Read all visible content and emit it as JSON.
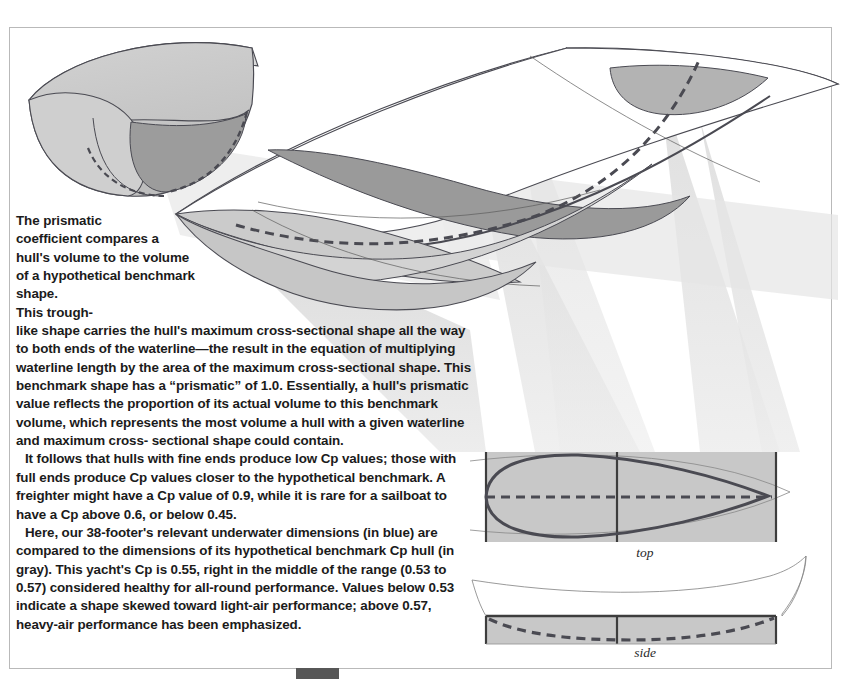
{
  "page": {
    "title": "The prismatic coefficient",
    "background_color": "#ffffff",
    "frame_color": "#b9b9b9"
  },
  "colors": {
    "hull_line": "#4a4a52",
    "benchmark_fill": "#c9c9c9",
    "benchmark_fill_light": "#dcdcdc",
    "shadow_fill": "#e0e0e0",
    "dark_section": "#9a9a9a",
    "mid_section": "#b5b5b5",
    "projection_ray": "#e3e3e3",
    "text": "#1b1b1b",
    "tab": "#575757",
    "caption": "#2a2a2a"
  },
  "body_copy": {
    "paragraph_1_lines": [
      "The prismatic",
      "coefficient compares",
      "a hull's volume to the",
      "volume of a hypothetical",
      "benchmark shape. This trough-",
      "like shape carries the hull's maximum",
      "cross-sectional shape all the way to both",
      "ends of the waterline—the result in the",
      "equation of multiplying waterline length by the",
      "area of the maximum cross-sectional shape. This",
      "benchmark shape has a “prismatic” of 1.0. Essentially, a",
      "hull's prismatic value reflects the proportion of its actual",
      "volume to this benchmark volume, which represents the most",
      "volume a hull with a given waterline and maximum cross-",
      "sectional shape could contain."
    ],
    "paragraph_2": "It follows that hulls with fine ends produce low Cp values; those with full ends produce Cp values closer to the hypothetical benchmark. A freighter might have a Cp value of 0.9, while it is rare for a sailboat to have a Cp above 0.6, or below 0.45.",
    "paragraph_3": "Here, our 38-footer's relevant underwater dimensions (in blue) are compared to the dimensions of its hypothetical benchmark Cp hull (in gray). This yacht's Cp is 0.55, right in the middle of the range (0.53 to 0.57) considered healthy for all-round performance. Values below 0.53 indicate a shape skewed toward light-air performance; above 0.57, heavy-air performance has been emphasized."
  },
  "captions": {
    "top_view": "top",
    "side_view": "side"
  },
  "figures": {
    "main_illustration": {
      "name": "prismatic-benchmark-hull-3d",
      "description": "Three-dimensional cutaway of a benchmark prismatic trough shape compared with an actual yacht hull, with projection rays falling to the plan and profile views below."
    },
    "top_view": {
      "name": "plan-view-comparison",
      "benchmark_shape": "rectangle",
      "actual_hull_shape": "fine-ended waterplane",
      "has_centerline": true,
      "has_dashed_axis": true
    },
    "side_view": {
      "name": "profile-view-comparison",
      "benchmark_shape": "rectangle",
      "actual_hull_shape": "canoe body profile",
      "has_centerline": true,
      "has_dashed_keel_line": true
    }
  },
  "values": {
    "yacht_length_ft": 38,
    "yacht_cp": 0.55,
    "healthy_range_low": 0.53,
    "healthy_range_high": 0.57,
    "freighter_cp": 0.9,
    "sailboat_cp_max": 0.6,
    "sailboat_cp_min": 0.45,
    "benchmark_prismatic": 1.0
  }
}
